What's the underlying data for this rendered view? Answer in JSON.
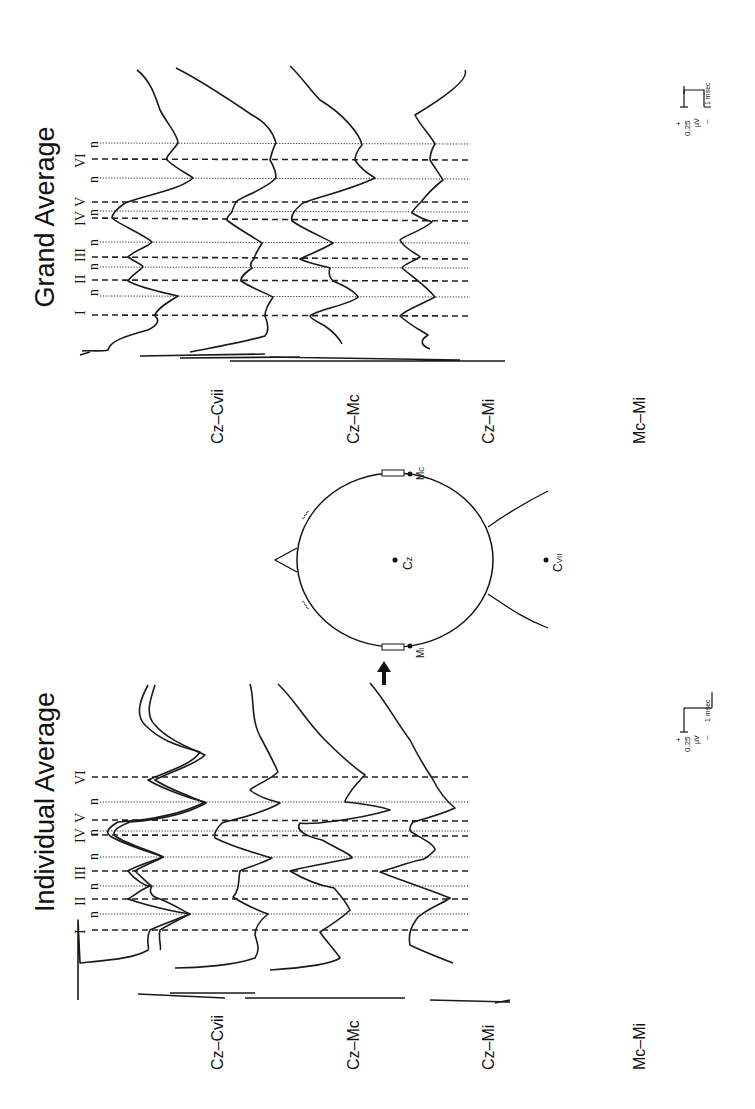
{
  "panels": {
    "grand": {
      "title": "Grand Average"
    },
    "individual": {
      "title": "Individual Average"
    }
  },
  "traces": {
    "labels": [
      "Cz–Cvii",
      "Cz–Mc",
      "Cz–Mi",
      "Mc–Mi"
    ],
    "label_parts": [
      {
        "main": "Cz–C",
        "sub": "VII"
      },
      {
        "main": "Cz–M",
        "sub": "C"
      },
      {
        "main": "Cz–M",
        "sub": "I"
      },
      {
        "main": "Mc–M",
        "sub": "I"
      }
    ]
  },
  "peaks": {
    "labels": [
      "I",
      "n",
      "II",
      "n",
      "III",
      "n",
      "IV",
      "n",
      "V",
      "n",
      "VI",
      "n"
    ],
    "roman": [
      "I",
      "II",
      "III",
      "IV",
      "V",
      "VI"
    ],
    "negative_label": "n"
  },
  "scale_bar": {
    "plus": "+",
    "minus": "–",
    "amplitude": "0.25",
    "amplitude_unit": "µV",
    "time": "1 msec"
  },
  "head": {
    "electrodes": [
      {
        "name": "Cz",
        "main": "C",
        "sub": "z"
      },
      {
        "name": "Cvii",
        "main": "C",
        "sub": "VII"
      },
      {
        "name": "Mc",
        "main": "M",
        "sub": "C"
      },
      {
        "name": "Mi",
        "main": "M",
        "sub": "I"
      }
    ],
    "stimulus_arrow": "arrow-icon"
  },
  "colors": {
    "ink": "#1a1a1a",
    "background": "#ffffff"
  }
}
